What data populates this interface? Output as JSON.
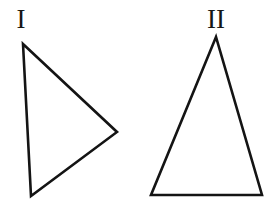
{
  "figure": {
    "background_color": "#ffffff",
    "stroke_color": "#141414",
    "stroke_width": 2.6,
    "triangles": [
      {
        "label": "I",
        "points": "23,44 117,132 31,196"
      },
      {
        "label": "II",
        "points": "216,37 151,195 262,195"
      }
    ]
  }
}
